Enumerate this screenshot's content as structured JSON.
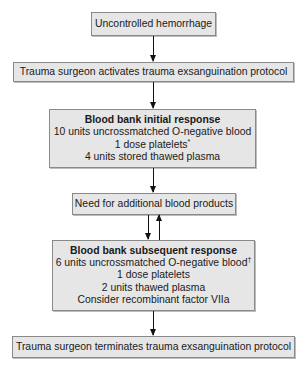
{
  "diagram": {
    "type": "flowchart",
    "nodes": [
      {
        "id": "n1",
        "lines": [
          "Uncontrolled hemorrhage"
        ]
      },
      {
        "id": "n2",
        "lines": [
          "Trauma surgeon activates trauma exsanguination protocol"
        ]
      },
      {
        "id": "n3",
        "title": "Blood bank initial response",
        "lines": [
          "10 units uncrossmatched O-negative blood",
          "1 dose platelets",
          "4 units stored thawed plasma"
        ],
        "footnote_marks": {
          "1": "*"
        }
      },
      {
        "id": "n4",
        "lines": [
          "Need for additional blood products"
        ]
      },
      {
        "id": "n5",
        "title": "Blood bank subsequent response",
        "lines": [
          "6 units uncrossmatched O-negative blood",
          "1 dose platelets",
          "2 units thawed plasma",
          "Consider recombinant factor VIIa"
        ],
        "footnote_marks": {
          "0": "†"
        }
      },
      {
        "id": "n6",
        "lines": [
          "Trauma surgeon terminates trauma exsanguination protocol"
        ]
      }
    ],
    "edges": [
      {
        "from": "n1",
        "to": "n2"
      },
      {
        "from": "n2",
        "to": "n3"
      },
      {
        "from": "n3",
        "to": "n4"
      },
      {
        "from": "n4",
        "to": "n5"
      },
      {
        "from": "n5",
        "to": "n4"
      },
      {
        "from": "n5",
        "to": "n6"
      }
    ]
  },
  "colors": {
    "box_fill": "#e6e6e6",
    "box_border": "#8a8a8a",
    "arrow": "#111111"
  }
}
